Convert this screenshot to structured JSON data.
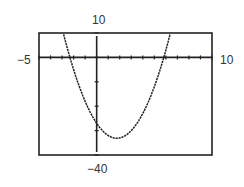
{
  "chart_data": {
    "type": "line",
    "title": "",
    "xlabel": "",
    "ylabel": "",
    "xlim": [
      -5,
      10
    ],
    "ylim": [
      -40,
      10
    ],
    "x_tick_step": 1,
    "y_tick_step": 10,
    "window_labels": {
      "xmin": "−5",
      "xmax": "10",
      "ymin": "−40",
      "ymax": "10"
    },
    "series": [
      {
        "name": "parabola",
        "equation_estimate": "y = 2x^2 - 7x - 27",
        "x": [
          -3,
          -2.25,
          -1,
          0,
          1,
          1.75,
          3,
          4,
          5,
          5.97,
          7
        ],
        "y": [
          12,
          0,
          -18,
          -27,
          -32,
          -33.1,
          -30,
          -23,
          -12,
          0,
          22
        ]
      }
    ],
    "grid": false,
    "legend": null
  }
}
